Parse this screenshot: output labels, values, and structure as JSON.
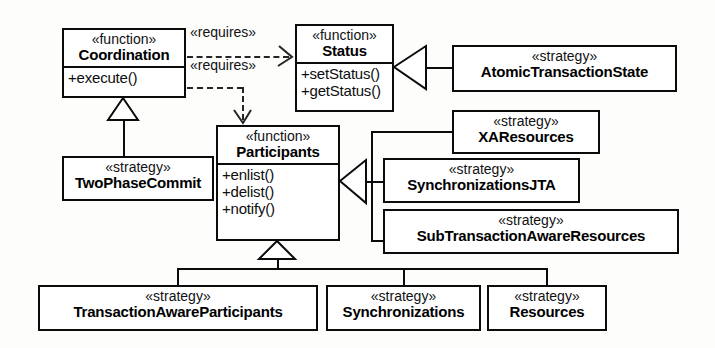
{
  "diagram": {
    "type": "uml-class-diagram",
    "background_color": "#fdfdfc",
    "line_color": "#0b0b0b",
    "stereotypes": {
      "function": "«function»",
      "strategy": "«strategy»"
    },
    "classes": [
      {
        "id": "coordination",
        "stereotype": "«function»",
        "name": "Coordination",
        "operations": [
          "+execute()"
        ],
        "x": 62,
        "y": 28,
        "w": 124,
        "h": 70
      },
      {
        "id": "status",
        "stereotype": "«function»",
        "name": "Status",
        "operations": [
          "+setStatus()",
          "+getStatus()"
        ],
        "x": 295,
        "y": 24,
        "w": 99,
        "h": 88
      },
      {
        "id": "participants",
        "stereotype": "«function»",
        "name": "Participants",
        "operations": [
          "+enlist()",
          "+delist()",
          "+notify()"
        ],
        "x": 216,
        "y": 125,
        "w": 124,
        "h": 116
      },
      {
        "id": "atomic-transaction-state",
        "stereotype": "«strategy»",
        "name": "AtomicTransactionState",
        "operations": [],
        "x": 452,
        "y": 45,
        "w": 225,
        "h": 47
      },
      {
        "id": "xaresources",
        "stereotype": "«strategy»",
        "name": "XAResources",
        "operations": [],
        "x": 452,
        "y": 110,
        "w": 148,
        "h": 44
      },
      {
        "id": "synchronizations-jta",
        "stereotype": "«strategy»",
        "name": "SynchronizationsJTA",
        "operations": [],
        "x": 383,
        "y": 158,
        "w": 197,
        "h": 45
      },
      {
        "id": "subtransaction-aware-resources",
        "stereotype": "«strategy»",
        "name": "SubTransactionAwareResources",
        "operations": [],
        "x": 383,
        "y": 209,
        "w": 296,
        "h": 45
      },
      {
        "id": "two-phase-commit",
        "stereotype": "«strategy»",
        "name": "TwoPhaseCommit",
        "operations": [],
        "x": 62,
        "y": 156,
        "w": 152,
        "h": 45
      },
      {
        "id": "transaction-aware-participants",
        "stereotype": "«strategy»",
        "name": "TransactionAwareParticipants",
        "operations": [],
        "x": 38,
        "y": 285,
        "w": 280,
        "h": 46
      },
      {
        "id": "synchronizations",
        "stereotype": "«strategy»",
        "name": "Synchronizations",
        "operations": [],
        "x": 326,
        "y": 285,
        "w": 155,
        "h": 46
      },
      {
        "id": "resources",
        "stereotype": "«strategy»",
        "name": "Resources",
        "operations": [],
        "x": 487,
        "y": 285,
        "w": 120,
        "h": 46
      }
    ],
    "dependencies": [
      {
        "id": "coordination-requires-status",
        "label": "«requires»",
        "from": "coordination",
        "to": "status"
      },
      {
        "id": "coordination-requires-participants",
        "label": "«requires»",
        "from": "coordination",
        "to": "participants"
      }
    ],
    "generalizations": [
      {
        "id": "two-phase-commit-to-coordination",
        "child": "two-phase-commit",
        "parent": "coordination"
      },
      {
        "id": "atomic-transaction-state-to-status",
        "child": "atomic-transaction-state",
        "parent": "status"
      },
      {
        "id": "xaresources-to-participants",
        "child": "xaresources",
        "parent": "participants"
      },
      {
        "id": "synchronizations-jta-to-participants",
        "child": "synchronizations-jta",
        "parent": "participants"
      },
      {
        "id": "subtransaction-aware-resources-to-participants",
        "child": "subtransaction-aware-resources",
        "parent": "participants"
      },
      {
        "id": "transaction-aware-participants-to-participants",
        "child": "transaction-aware-participants",
        "parent": "participants"
      },
      {
        "id": "synchronizations-to-participants",
        "child": "synchronizations",
        "parent": "participants"
      },
      {
        "id": "resources-to-participants",
        "child": "resources",
        "parent": "participants"
      }
    ]
  }
}
